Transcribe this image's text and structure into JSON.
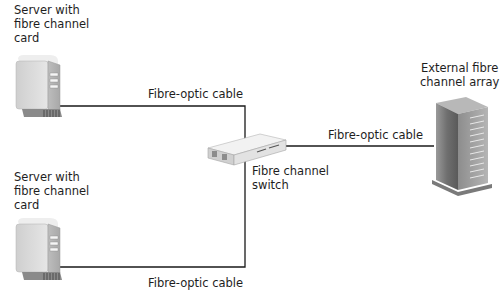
{
  "diagram": {
    "nodes": [
      {
        "id": "server-1",
        "type": "server",
        "label": "Server with\nfibre channel\ncard"
      },
      {
        "id": "server-2",
        "type": "server",
        "label": "Server with\nfibre channel\ncard"
      },
      {
        "id": "switch",
        "type": "fibre-channel-switch",
        "label": "Fibre channel\nswitch"
      },
      {
        "id": "array",
        "type": "storage-array",
        "label": "External fibre\nchannel array"
      }
    ],
    "edges": [
      {
        "from": "server-1",
        "to": "switch",
        "label": "Fibre-optic cable"
      },
      {
        "from": "server-2",
        "to": "switch",
        "label": "Fibre-optic cable"
      },
      {
        "from": "switch",
        "to": "array",
        "label": "Fibre-optic cable"
      }
    ],
    "colors": {
      "line": "#1a1a1a",
      "device_body": "#d8d8d8",
      "device_shadow": "#8a8a8a"
    }
  }
}
